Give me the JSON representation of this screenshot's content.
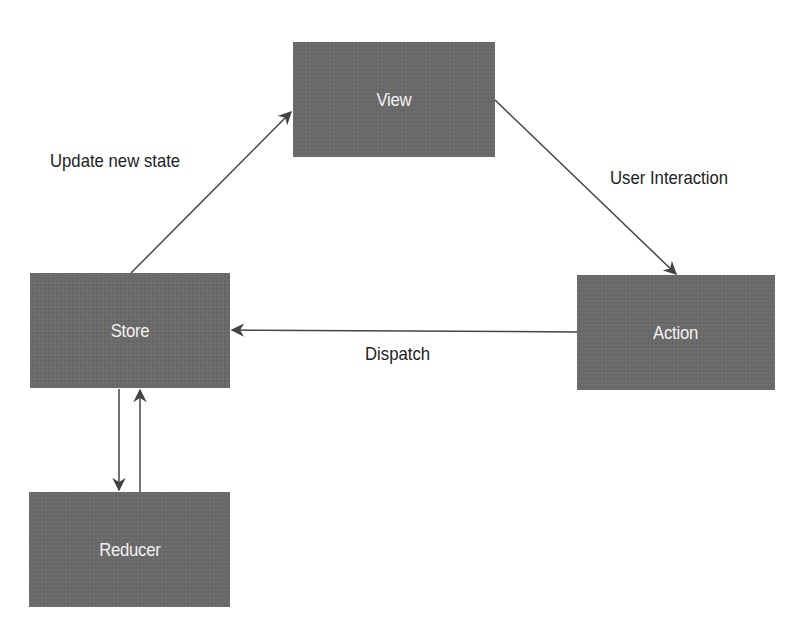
{
  "diagram": {
    "nodes": [
      {
        "id": "view",
        "label": "View"
      },
      {
        "id": "store",
        "label": "Store"
      },
      {
        "id": "action",
        "label": "Action"
      },
      {
        "id": "reducer",
        "label": "Reducer"
      }
    ],
    "edges": [
      {
        "from": "store",
        "to": "view",
        "label": "Update new state"
      },
      {
        "from": "view",
        "to": "action",
        "label": "User Interaction"
      },
      {
        "from": "action",
        "to": "store",
        "label": "Dispatch"
      },
      {
        "from": "store",
        "to": "reducer",
        "label": ""
      },
      {
        "from": "reducer",
        "to": "store",
        "label": ""
      }
    ],
    "colors": {
      "box_fill": "#6b6b6b",
      "box_text": "#f2f2f2",
      "edge": "#444444",
      "label_text": "#222222"
    }
  }
}
